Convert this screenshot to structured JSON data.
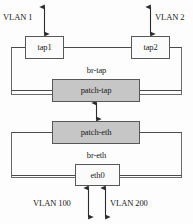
{
  "diagram": {
    "type": "network-topology",
    "colors": {
      "background": "#fdfdfd",
      "box_stroke": "#58585a",
      "box_fill_white": "#fbfbfb",
      "box_fill_gray": "#c6c6c6",
      "line": "#3a3a3a",
      "text": "#1b1b1b"
    },
    "bridges": [
      {
        "id": "br-tap",
        "label": "br-tap"
      },
      {
        "id": "br-eth",
        "label": "br-eth"
      }
    ],
    "nodes": [
      {
        "id": "tap1",
        "label": "tap1",
        "fill": "white"
      },
      {
        "id": "tap2",
        "label": "tap2",
        "fill": "white"
      },
      {
        "id": "patch-tap",
        "label": "patch-tap",
        "fill": "gray"
      },
      {
        "id": "patch-eth",
        "label": "patch-eth",
        "fill": "gray"
      },
      {
        "id": "eth0",
        "label": "eth0",
        "fill": "white"
      }
    ],
    "vlan_labels": [
      {
        "id": "vlan1",
        "label": "VLAN 1",
        "attached_to": "tap1"
      },
      {
        "id": "vlan2",
        "label": "VLAN 2",
        "attached_to": "tap2"
      },
      {
        "id": "vlan100",
        "label": "VLAN 100",
        "attached_to": "eth0"
      },
      {
        "id": "vlan200",
        "label": "VLAN 200",
        "attached_to": "eth0"
      }
    ],
    "connections": [
      {
        "from": "vlan1-external",
        "to": "tap1",
        "style": "double-arrow"
      },
      {
        "from": "vlan2-external",
        "to": "tap2",
        "style": "double-arrow"
      },
      {
        "from": "patch-tap",
        "to": "patch-eth",
        "style": "double-arrow"
      },
      {
        "from": "eth0",
        "to": "vlan100-external",
        "style": "double-arrow"
      },
      {
        "from": "eth0",
        "to": "vlan200-external",
        "style": "double-arrow"
      }
    ]
  }
}
